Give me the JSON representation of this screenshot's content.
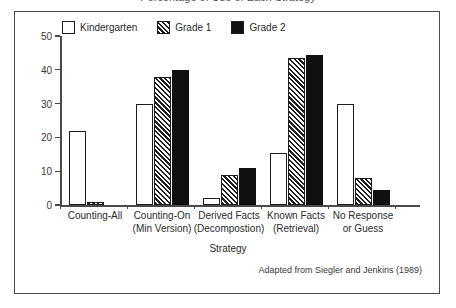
{
  "figure": {
    "clipped_title": "Percentage of Use of Each Strategy",
    "attribution": "Adapted from Siegler and Jenkins (1989)"
  },
  "legend": {
    "position": "top-inside",
    "entries": [
      {
        "label": "Kindergarten",
        "swatch": "open-square-icon",
        "color": "#ffffff"
      },
      {
        "label": "Grade 1",
        "swatch": "hatched-square-icon",
        "color": "#1d1d1d"
      },
      {
        "label": "Grade 2",
        "swatch": "solid-square-icon",
        "color": "#101010"
      }
    ]
  },
  "axes": {
    "y_title": "Percentage of Use",
    "x_title": "Strategy",
    "y_ticks": [
      "0",
      "10",
      "20",
      "30",
      "40",
      "50"
    ]
  },
  "chart_data": {
    "type": "bar",
    "title": "Percentage of Use of Each Strategy",
    "xlabel": "Strategy",
    "ylabel": "Percentage of Use",
    "ylim": [
      0,
      50
    ],
    "yticks": [
      0,
      10,
      20,
      30,
      40,
      50
    ],
    "grid": false,
    "legend_position": "top",
    "annotations": [
      "Adapted from Siegler and Jenkins (1989)"
    ],
    "categories": [
      "Counting-All",
      "Counting-On (Min Version)",
      "Derived Facts (Decompostion)",
      "Known Facts (Retrieval)",
      "No Response or Guess"
    ],
    "category_lines": [
      [
        "Counting-All",
        ""
      ],
      [
        "Counting-On",
        "(Min Version)"
      ],
      [
        "Derived Facts",
        "(Decompostion)"
      ],
      [
        "Known Facts",
        "(Retrieval)"
      ],
      [
        "No Response",
        "or Guess"
      ]
    ],
    "series": [
      {
        "name": "Kindergarten",
        "values": [
          22,
          30,
          2,
          15.5,
          30
        ]
      },
      {
        "name": "Grade 1",
        "values": [
          1,
          38,
          9,
          43.5,
          8
        ]
      },
      {
        "name": "Grade 2",
        "values": [
          0,
          40,
          11,
          44.5,
          4.5
        ]
      }
    ]
  }
}
